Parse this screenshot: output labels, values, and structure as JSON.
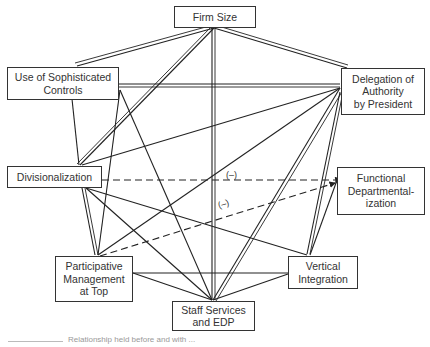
{
  "nodes": {
    "firm_size": "Firm Size",
    "sophisticated_controls": "Use of Sophisticated\nControls",
    "delegation": "Delegation of\nAuthority\nby President",
    "divisionalization": "Divisionalization",
    "functional": "Functional\nDepartmental-\nization",
    "participative": "Participative\nManagement\nat Top",
    "vertical": "Vertical\nIntegration",
    "staff": "Staff Services\nand EDP"
  },
  "edge_labels": {
    "div_func": "(–)",
    "part_func": "(–)"
  },
  "caption": "Relationship held before and with ...",
  "edges": [
    {
      "from": "firm_size",
      "to": "sophisticated_controls",
      "style": "double"
    },
    {
      "from": "firm_size",
      "to": "delegation",
      "style": "double"
    },
    {
      "from": "firm_size",
      "to": "divisionalization",
      "style": "double"
    },
    {
      "from": "firm_size",
      "to": "staff",
      "style": "double"
    },
    {
      "from": "sophisticated_controls",
      "to": "delegation",
      "style": "double"
    },
    {
      "from": "sophisticated_controls",
      "to": "divisionalization",
      "style": "single"
    },
    {
      "from": "sophisticated_controls",
      "to": "participative",
      "style": "single"
    },
    {
      "from": "sophisticated_controls",
      "to": "staff",
      "style": "single"
    },
    {
      "from": "delegation",
      "to": "divisionalization",
      "style": "single"
    },
    {
      "from": "delegation",
      "to": "participative",
      "style": "single"
    },
    {
      "from": "delegation",
      "to": "staff",
      "style": "double"
    },
    {
      "from": "delegation",
      "to": "vertical",
      "style": "double"
    },
    {
      "from": "divisionalization",
      "to": "functional",
      "style": "dashed",
      "label": "(–)"
    },
    {
      "from": "divisionalization",
      "to": "participative",
      "style": "double"
    },
    {
      "from": "divisionalization",
      "to": "vertical",
      "style": "single"
    },
    {
      "from": "divisionalization",
      "to": "staff",
      "style": "single"
    },
    {
      "from": "participative",
      "to": "functional",
      "style": "dashed",
      "label": "(–)"
    },
    {
      "from": "participative",
      "to": "staff",
      "style": "single"
    },
    {
      "from": "participative",
      "to": "vertical",
      "style": "single"
    },
    {
      "from": "vertical",
      "to": "staff",
      "style": "single"
    },
    {
      "from": "functional",
      "to": "vertical",
      "style": "single"
    }
  ]
}
